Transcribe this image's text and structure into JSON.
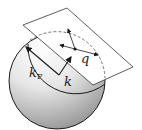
{
  "diagram": {
    "labels": {
      "kF_main": "k",
      "kF_sub": "F",
      "k": "k",
      "q": "q"
    },
    "colors": {
      "line": "#1a1a1a",
      "sphere_light": "#ffffff",
      "sphere_dark": "#9a9a9a",
      "plane_fill": "#ffffff"
    }
  }
}
